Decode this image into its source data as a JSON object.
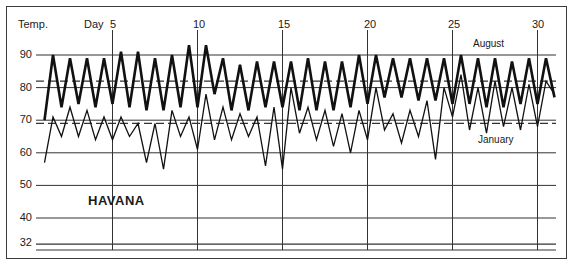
{
  "chart_data": {
    "type": "line",
    "title": "HAVANA",
    "ylabel": "Temp.",
    "xlabel": "Day",
    "ylim": [
      30,
      95
    ],
    "xlim": [
      1,
      31
    ],
    "y_ticks": [
      32,
      40,
      50,
      60,
      70,
      80,
      90
    ],
    "x_ticks": [
      5,
      10,
      15,
      20,
      25,
      30
    ],
    "grid": true,
    "reference_lines": [
      {
        "type": "dashed",
        "value": 82,
        "description": "August mean"
      },
      {
        "type": "dashed",
        "value": 69,
        "description": "January mean"
      }
    ],
    "series": [
      {
        "name": "August",
        "style": "thick",
        "x": [
          1,
          1.5,
          2,
          2.5,
          3,
          3.5,
          4,
          4.5,
          5,
          5.5,
          6,
          6.5,
          7,
          7.5,
          8,
          8.5,
          9,
          9.5,
          10,
          10.5,
          11,
          11.5,
          12,
          12.5,
          13,
          13.5,
          14,
          14.5,
          15,
          15.5,
          16,
          16.5,
          17,
          17.5,
          18,
          18.5,
          19,
          19.5,
          20,
          20.5,
          21,
          21.5,
          22,
          22.5,
          23,
          23.5,
          24,
          24.5,
          25,
          25.5,
          26,
          26.5,
          27,
          27.5,
          28,
          28.5,
          29,
          29.5,
          30,
          30.5,
          31
        ],
        "values": [
          70,
          90,
          74,
          89,
          75,
          89,
          74,
          89,
          75,
          91,
          74,
          91,
          73,
          89,
          73,
          90,
          74,
          93,
          74,
          93,
          78,
          89,
          73,
          87,
          73,
          88,
          74,
          88,
          74,
          88,
          73,
          89,
          73,
          88,
          73,
          88,
          74,
          90,
          75,
          90,
          77,
          89,
          77,
          89,
          76,
          89,
          76,
          89,
          75,
          90,
          75,
          89,
          74,
          89,
          74,
          88,
          75,
          89,
          75,
          89,
          77
        ],
        "label_position": "top-right"
      },
      {
        "name": "January",
        "style": "thin",
        "x": [
          1,
          1.5,
          2,
          2.5,
          3,
          3.5,
          4,
          4.5,
          5,
          5.5,
          6,
          6.5,
          7,
          7.5,
          8,
          8.5,
          9,
          9.5,
          10,
          10.5,
          11,
          11.5,
          12,
          12.5,
          13,
          13.5,
          14,
          14.5,
          15,
          15.5,
          16,
          16.5,
          17,
          17.5,
          18,
          18.5,
          19,
          19.5,
          20,
          20.5,
          21,
          21.5,
          22,
          22.5,
          23,
          23.5,
          24,
          24.5,
          25,
          25.5,
          26,
          26.5,
          27,
          27.5,
          28,
          28.5,
          29,
          29.5,
          30,
          30.5,
          31
        ],
        "values": [
          57,
          71,
          65,
          74,
          65,
          73,
          64,
          71,
          64,
          71,
          65,
          69,
          57,
          69,
          55,
          73,
          65,
          71,
          61,
          78,
          64,
          74,
          64,
          72,
          65,
          71,
          56,
          74,
          55,
          80,
          66,
          74,
          64,
          73,
          62,
          72,
          60,
          73,
          64,
          80,
          67,
          72,
          63,
          73,
          65,
          76,
          58,
          80,
          71,
          84,
          67,
          80,
          66,
          82,
          68,
          80,
          67,
          81,
          68,
          82,
          78
        ],
        "label_position": "below-right"
      }
    ]
  },
  "labels": {
    "y_axis": "Temp.",
    "x_axis": "Day",
    "city": "HAVANA",
    "august": "August",
    "january": "January",
    "y_ticks": [
      "90",
      "80",
      "70",
      "60",
      "50",
      "40",
      "32"
    ],
    "x_ticks": [
      "5",
      "10",
      "15",
      "20",
      "25",
      "30"
    ]
  }
}
